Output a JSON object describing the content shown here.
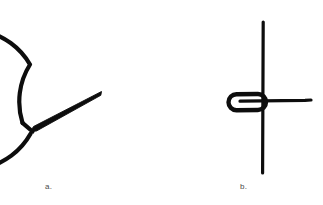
{
  "figure": {
    "background_color": "#ffffff",
    "ink_color": "#0d0d0d",
    "caption_color": "#4a4a4a",
    "panels": [
      {
        "id": "panel-a",
        "caption": "a.",
        "description": "hand-drawn circle with a narrow wedge-shaped needle pointing from the center down to the lower-left, and a small notch gap in the circle outline at the lower left",
        "circle": {
          "center_x": 91,
          "center_y": 99,
          "radius": 70,
          "stroke_width": 4,
          "gap_start_deg": 150,
          "gap_end_deg": 196
        },
        "needle": {
          "tip_x": 101,
          "tip_y": 92,
          "base_x": 31,
          "base_y": 128,
          "base_width": 6
        }
      },
      {
        "id": "panel-b",
        "caption": "b.",
        "description": "a long vertical line crossed by a horizontal line, with an elongated rounded loop on the left side of the crossing point",
        "vertical_line": {
          "x": 263,
          "y_top": 22,
          "y_bottom": 173,
          "stroke_width": 3
        },
        "horizontal_line": {
          "y": 101,
          "x_left": 240,
          "x_right": 311,
          "stroke_width": 3
        },
        "loop": {
          "x_left": 227,
          "x_right": 266,
          "y_top": 94,
          "y_bottom": 110,
          "stroke_width": 4
        }
      }
    ]
  }
}
